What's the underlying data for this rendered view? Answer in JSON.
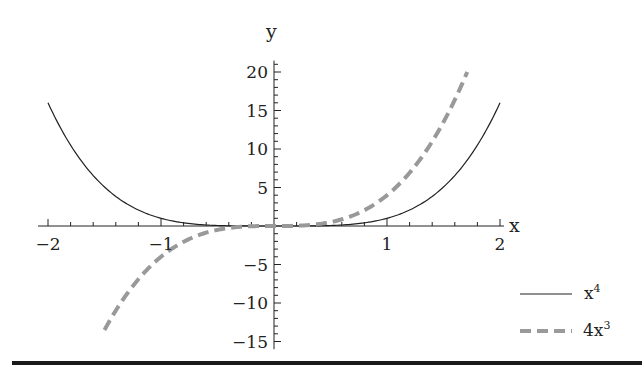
{
  "chart_data": {
    "type": "line",
    "title": "",
    "xlabel": "x",
    "ylabel": "y",
    "xlim": [
      -2,
      2
    ],
    "ylim": [
      -16,
      22
    ],
    "grid": false,
    "legend_position": "lower right",
    "x_ticks": [
      "-2",
      "-1",
      "1",
      "2"
    ],
    "y_ticks": [
      "-15",
      "-10",
      "-5",
      "5",
      "10",
      "15",
      "20"
    ],
    "series": [
      {
        "name": "x^4",
        "style": "solid",
        "color": "#222222",
        "domain": [
          -2,
          2
        ],
        "x": [
          -2,
          -1.5,
          -1,
          -0.5,
          0,
          0.5,
          1,
          1.5,
          2
        ],
        "values": [
          16,
          5.06,
          1,
          0.06,
          0,
          0.06,
          1,
          5.06,
          16
        ]
      },
      {
        "name": "4x^3",
        "style": "dashed",
        "color": "#999999",
        "domain": [
          -1.5,
          1.71
        ],
        "x": [
          -1.5,
          -1,
          -0.5,
          0,
          0.5,
          1,
          1.5,
          1.71
        ],
        "values": [
          -13.5,
          -4,
          -0.5,
          0,
          0.5,
          4,
          13.5,
          20
        ]
      }
    ]
  },
  "axes": {
    "x_label": "x",
    "y_label": "y"
  },
  "legend": {
    "items": [
      {
        "base": "x",
        "sup": "4",
        "style": "solid"
      },
      {
        "base": "4x",
        "sup": "3",
        "style": "dashed"
      }
    ]
  }
}
